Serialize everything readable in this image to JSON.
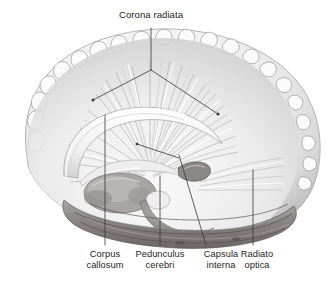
{
  "figure": {
    "name": "brain-medial-white-matter-tracts",
    "background_color": "#ffffff",
    "ink_color": "#2a2526",
    "leader_line_color": "#3b3536",
    "tissue_light": "#f4f4f4",
    "tissue_mid": "#c9c9c9",
    "tissue_dark": "#8d8d8d",
    "tissue_darkest": "#5c5858"
  },
  "labels": {
    "corona_radiata": "Corona radiata",
    "corpus_callosum": "Corpus\ncallosum",
    "pedunculus_cerebri": "Pedunculus\ncerebri",
    "capsula_interna": "Capsula\ninterna",
    "radiato_optica": "Radiato\noptica"
  },
  "leaders": {
    "corona_radiata_stem": {
      "x1": 151,
      "y1": 28,
      "x2": 151,
      "y2": 70
    },
    "corona_radiata_left_arm": {
      "x1": 151,
      "y1": 70,
      "x2": 93,
      "y2": 100
    },
    "corona_radiata_right_arm": {
      "x1": 151,
      "y1": 70,
      "x2": 218,
      "y2": 114
    },
    "corpus_callosum": {
      "x1": 105,
      "y1": 115,
      "x2": 105,
      "y2": 245
    },
    "pedunculus_cerebri": {
      "x1": 160,
      "y1": 176,
      "x2": 160,
      "y2": 245
    },
    "pedunculus_cerebri_pointer": {
      "x1": 137,
      "y1": 144,
      "x2": 179,
      "y2": 158
    },
    "capsula_interna": {
      "x1": 179,
      "y1": 155,
      "x2": 206,
      "y2": 245
    },
    "radiato_optica": {
      "x1": 253,
      "y1": 170,
      "x2": 253,
      "y2": 245
    }
  },
  "label_positions": {
    "corona_radiata": {
      "left": 103,
      "top": 9,
      "width": 96
    },
    "corpus_callosum": {
      "left": 73,
      "top": 249,
      "width": 64
    },
    "pedunculus_cerebri": {
      "left": 126,
      "top": 249,
      "width": 68
    },
    "capsula_interna": {
      "left": 190,
      "top": 249,
      "width": 62
    },
    "radiato_optica": {
      "left": 228,
      "top": 249,
      "width": 58
    }
  }
}
